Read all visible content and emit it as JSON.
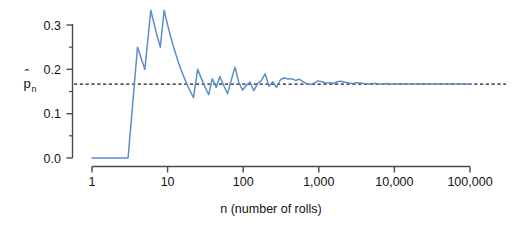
{
  "chart_data": {
    "type": "line",
    "title": "",
    "subtitle": "",
    "xlabel": "n (number of rolls)",
    "ylabel": "p̂ₙ",
    "ylabel_base": "p",
    "ylabel_hat": "ˆ",
    "ylabel_subscript": "n",
    "xscale": "log",
    "yscale": "linear",
    "xlim": [
      1,
      100000
    ],
    "ylim": [
      0.0,
      0.345
    ],
    "grid": false,
    "legend": "none",
    "xtick_labels": [
      "1",
      "10",
      "100",
      "1,000",
      "10,000",
      "100,000"
    ],
    "xtick_values": [
      1,
      10,
      100,
      1000,
      10000,
      100000
    ],
    "ytick_labels": [
      "0.0",
      "0.1",
      "0.2",
      "0.3"
    ],
    "ytick_values": [
      0.0,
      0.1,
      0.2,
      0.3
    ],
    "yminor_tick_values": [
      0.05,
      0.15,
      0.25
    ],
    "series": [
      {
        "name": "running proportion",
        "color": "#5b8fc9",
        "x": [
          1,
          2,
          3,
          4,
          5,
          6,
          7,
          8,
          9,
          10,
          11,
          12,
          13,
          14,
          15,
          16,
          18,
          20,
          22,
          25,
          28,
          31,
          35,
          39,
          44,
          49,
          55,
          62,
          69,
          78,
          87,
          98,
          110,
          123,
          138,
          155,
          174,
          195,
          219,
          246,
          276,
          310,
          348,
          390,
          438,
          492,
          552,
          620,
          696,
          781,
          877,
          984,
          1105,
          1240,
          1392,
          1562,
          1754,
          1969,
          2210,
          2481,
          2785,
          3126,
          3509,
          3939,
          4421,
          4963,
          5571,
          6254,
          7020,
          7880,
          8845,
          9929,
          11144,
          12510,
          14043,
          15764,
          17695,
          19861,
          22292,
          25020,
          28081,
          31517,
          35373,
          39703,
          44566,
          50024,
          56156,
          63041,
          70767,
          79433,
          89141,
          100000
        ],
        "y": [
          0.0,
          0.0,
          0.0,
          0.25,
          0.2,
          0.333,
          0.286,
          0.25,
          0.333,
          0.3,
          0.273,
          0.25,
          0.231,
          0.214,
          0.2,
          0.1875,
          0.167,
          0.15,
          0.136,
          0.2,
          0.179,
          0.161,
          0.143,
          0.179,
          0.159,
          0.184,
          0.164,
          0.145,
          0.174,
          0.205,
          0.172,
          0.153,
          0.164,
          0.171,
          0.152,
          0.168,
          0.175,
          0.19,
          0.162,
          0.172,
          0.159,
          0.176,
          0.181,
          0.178,
          0.179,
          0.175,
          0.178,
          0.172,
          0.167,
          0.166,
          0.169,
          0.174,
          0.172,
          0.169,
          0.17,
          0.168,
          0.172,
          0.173,
          0.171,
          0.169,
          0.168,
          0.17,
          0.169,
          0.168,
          0.167,
          0.168,
          0.168,
          0.167,
          0.167,
          0.168,
          0.167,
          0.167,
          0.167,
          0.167,
          0.1667,
          0.167,
          0.1667,
          0.1667,
          0.1668,
          0.1667,
          0.1667,
          0.1667,
          0.1667,
          0.1667,
          0.1667,
          0.1667,
          0.1667,
          0.1667,
          0.1667,
          0.1667,
          0.1667,
          0.1667
        ]
      }
    ],
    "reference_line": {
      "name": "theoretical probability",
      "value": 0.1667,
      "orientation": "horizontal",
      "style": "dashed",
      "color": "#1a1a1a"
    },
    "annotations": []
  }
}
